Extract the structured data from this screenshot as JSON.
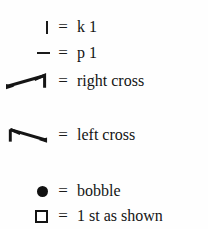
{
  "legend": {
    "title": "Knitting chart key",
    "background_color": "#fefefe",
    "ink_color": "#1a1a1a",
    "equals_sign": "=",
    "rows": [
      {
        "symbol_name": "vertical-bar-symbol",
        "symbol_glyph": "|",
        "equals": "=",
        "label": "k 1"
      },
      {
        "symbol_name": "horizontal-dash-symbol",
        "symbol_glyph": "–",
        "equals": "=",
        "label": "p 1"
      },
      {
        "symbol_name": "right-cross-cable-symbol",
        "symbol_glyph": "right-cross",
        "equals": "=",
        "label": "right cross"
      },
      {
        "symbol_name": "left-cross-cable-symbol",
        "symbol_glyph": "left-cross",
        "equals": "=",
        "label": "left cross"
      },
      {
        "symbol_name": "filled-circle-symbol",
        "symbol_glyph": "●",
        "equals": "=",
        "label": "bobble"
      },
      {
        "symbol_name": "open-square-symbol",
        "symbol_glyph": "□",
        "equals": "=",
        "label": "1 st as shown"
      }
    ]
  }
}
